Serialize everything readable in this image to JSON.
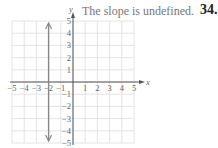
{
  "caption": "The slope is undefined.",
  "problem_number": "34.",
  "chart_data": {
    "type": "line",
    "title": "The slope is undefined.",
    "xlabel": "x",
    "ylabel": "y",
    "xlim": [
      -5,
      5
    ],
    "ylim": [
      -5,
      5
    ],
    "grid": true,
    "x_ticks": [
      -5,
      -4,
      -3,
      -2,
      -1,
      1,
      2,
      3,
      4,
      5
    ],
    "y_ticks": [
      -5,
      -4,
      -3,
      -2,
      -1,
      1,
      2,
      3,
      4,
      5
    ],
    "series": [
      {
        "name": "x = -2",
        "kind": "vertical-line",
        "x": [
          -2,
          -2
        ],
        "y": [
          -5,
          5
        ],
        "arrows": "both",
        "color": "#888888"
      }
    ]
  }
}
